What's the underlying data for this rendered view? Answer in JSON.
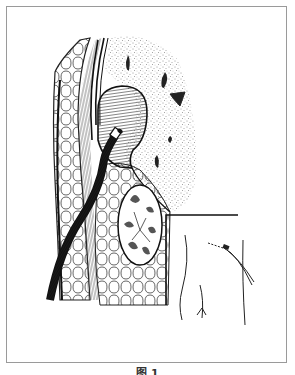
{
  "figure": {
    "caption": "图 1"
  },
  "labels": {
    "cyst": "cystic cavity (hatched)",
    "catheter": "drainage catheter",
    "parenchyma": "stippled organ tissue",
    "kidney": "kidney cross-section",
    "inset": "body surface inset with sutured catheter exit"
  },
  "colors": {
    "line": "#1a1a1a",
    "frame": "#9a9a9a",
    "background": "#ffffff"
  }
}
